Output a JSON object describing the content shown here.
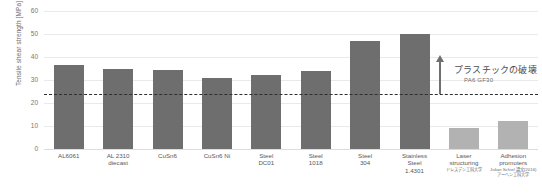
{
  "chart_data": {
    "type": "bar",
    "title": "",
    "xlabel": "",
    "ylabel": "Tensile shear strength [MPa]",
    "ylim": [
      0,
      60
    ],
    "ytick_values": [
      60,
      50,
      40,
      30,
      20,
      10,
      0
    ],
    "ytick_labels": [
      "60",
      "50",
      "40",
      "30",
      "20",
      "10",
      "0"
    ],
    "grid": true,
    "legend": "none",
    "categories": [
      "AL6061",
      "AL 2310 diecast",
      "CuSn6",
      "CuSn6 Ni",
      "Steel DC01",
      "Steel 1018",
      "Steel 304",
      "Stainless Steel 1.4301",
      "Laser structuring",
      "Adhesion promoters"
    ],
    "values": [
      36.5,
      35.0,
      34.5,
      31.0,
      32.0,
      34.0,
      47.0,
      50.0,
      9.0,
      12.0
    ],
    "bar_colors": [
      "#6e6e6e",
      "#6e6e6e",
      "#6e6e6e",
      "#6e6e6e",
      "#6e6e6e",
      "#6e6e6e",
      "#6e6e6e",
      "#6e6e6e",
      "#b2b2b2",
      "#b2b2b2"
    ],
    "annotations": {
      "threshold_line": {
        "value": 24,
        "style": "dashed",
        "color": "#2f2f2f"
      },
      "arrow": {
        "direction": "up",
        "from_value": 24,
        "to_value": 41,
        "color": "#6f6f6f"
      },
      "callout": {
        "main": "プラスチックの破壊",
        "sub": "PA6 GF30"
      }
    }
  },
  "axis": {
    "y_title": "Tensile shear strength [MPa]"
  },
  "x_categories": [
    {
      "line1": "AL6061",
      "line2": "",
      "line3": "",
      "note": "",
      "note_ja": ""
    },
    {
      "line1": "AL 2310",
      "line2": "diecast",
      "line3": "",
      "note": "",
      "note_ja": ""
    },
    {
      "line1": "CuSn6",
      "line2": "",
      "line3": "",
      "note": "",
      "note_ja": ""
    },
    {
      "line1": "CuSn6 Ni",
      "line2": "",
      "line3": "",
      "note": "",
      "note_ja": ""
    },
    {
      "line1": "Steel",
      "line2": "DC01",
      "line3": "",
      "note": "",
      "note_ja": ""
    },
    {
      "line1": "Steel",
      "line2": "1018",
      "line3": "",
      "note": "",
      "note_ja": ""
    },
    {
      "line1": "Steel",
      "line2": "304",
      "line3": "",
      "note": "",
      "note_ja": ""
    },
    {
      "line1": "Stainless",
      "line2": "Steel",
      "line3": "1.4301",
      "note": "",
      "note_ja": ""
    },
    {
      "line1": "Laser",
      "line2": "structuring",
      "line3": "",
      "note": "",
      "note_ja": "ドレスデン工科大学"
    },
    {
      "line1": "Adhesion",
      "line2": "promoters",
      "line3": "",
      "note": "Julian Schiel 論文(2016)",
      "note_ja": "アーヘン工科大学"
    }
  ],
  "callout": {
    "main": "プラスチックの破壊",
    "sub": "PA6 GF30"
  },
  "colors": {
    "bar_dark": "#6e6e6e",
    "bar_light": "#b2b2b2",
    "threshold": "#2f2f2f",
    "grid": "#e9e9e9",
    "text": "#58585a"
  }
}
